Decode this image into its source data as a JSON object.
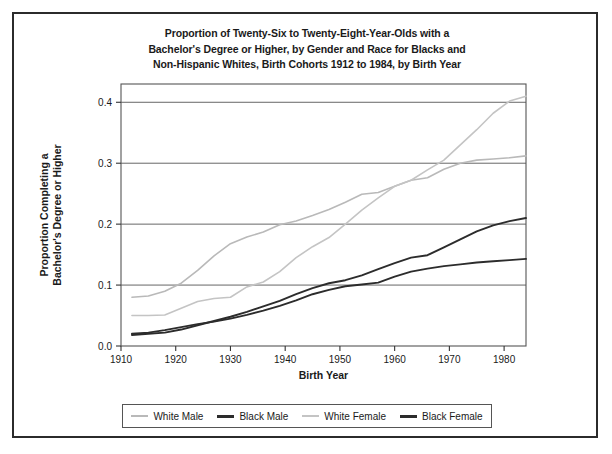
{
  "figure": {
    "title_lines": [
      "Proportion of Twenty-Six to Twenty-Eight-Year-Olds with a",
      "Bachelor's Degree or Higher, by Gender and Race for Blacks and",
      "Non-Hispanic Whites, Birth Cohorts 1912 to 1984, by Birth Year"
    ]
  },
  "chart_data": {
    "type": "line",
    "title": "Proportion of Twenty-Six to Twenty-Eight-Year-Olds with a Bachelor's Degree or Higher, by Gender and Race for Blacks and Non-Hispanic Whites, Birth Cohorts 1912 to 1984, by Birth Year",
    "xlabel": "Birth Year",
    "ylabel": "Proportion Completing a Bachelor's Degree or Higher",
    "xlim": [
      1910,
      1984
    ],
    "ylim": [
      0.0,
      0.43
    ],
    "xticks": [
      1910,
      1920,
      1930,
      1940,
      1950,
      1960,
      1970,
      1980
    ],
    "xtick_labels": [
      "1910",
      "1920",
      "1930",
      "1940",
      "1950",
      "1960",
      "1970",
      "1980"
    ],
    "yticks": [
      0.0,
      0.1,
      0.2,
      0.3,
      0.4
    ],
    "ytick_labels": [
      "0.0",
      "0.1",
      "0.2",
      "0.3",
      "0.4"
    ],
    "grid": "horizontal",
    "legend_position": "below-axes",
    "series": [
      {
        "name": "White Male",
        "color": "#b9b9b9",
        "width": 1.6,
        "x": [
          1912,
          1915,
          1918,
          1921,
          1924,
          1927,
          1930,
          1933,
          1936,
          1939,
          1942,
          1945,
          1948,
          1951,
          1954,
          1957,
          1960,
          1963,
          1966,
          1969,
          1972,
          1975,
          1978,
          1981,
          1984
        ],
        "values": [
          0.08,
          0.082,
          0.09,
          0.103,
          0.124,
          0.148,
          0.168,
          0.179,
          0.187,
          0.199,
          0.205,
          0.214,
          0.224,
          0.236,
          0.249,
          0.252,
          0.262,
          0.272,
          0.276,
          0.29,
          0.3,
          0.305,
          0.307,
          0.309,
          0.312
        ]
      },
      {
        "name": "Black Male",
        "color": "#2c2c2c",
        "width": 1.9,
        "x": [
          1912,
          1915,
          1918,
          1921,
          1924,
          1927,
          1930,
          1933,
          1936,
          1939,
          1942,
          1945,
          1948,
          1951,
          1954,
          1957,
          1960,
          1963,
          1966,
          1969,
          1972,
          1975,
          1978,
          1981,
          1984
        ],
        "values": [
          0.018,
          0.02,
          0.022,
          0.027,
          0.034,
          0.041,
          0.048,
          0.056,
          0.065,
          0.074,
          0.085,
          0.095,
          0.103,
          0.108,
          0.116,
          0.126,
          0.136,
          0.145,
          0.149,
          0.162,
          0.175,
          0.188,
          0.198,
          0.205,
          0.21
        ]
      },
      {
        "name": "White Female",
        "color": "#c4c4c4",
        "width": 1.6,
        "x": [
          1912,
          1915,
          1918,
          1921,
          1924,
          1927,
          1930,
          1933,
          1936,
          1939,
          1942,
          1945,
          1948,
          1951,
          1954,
          1957,
          1960,
          1963,
          1966,
          1969,
          1972,
          1975,
          1978,
          1981,
          1984
        ],
        "values": [
          0.05,
          0.05,
          0.051,
          0.062,
          0.073,
          0.078,
          0.08,
          0.097,
          0.105,
          0.122,
          0.145,
          0.163,
          0.178,
          0.2,
          0.223,
          0.243,
          0.262,
          0.272,
          0.289,
          0.305,
          0.33,
          0.355,
          0.382,
          0.402,
          0.41
        ]
      },
      {
        "name": "Black Female",
        "color": "#2c2c2c",
        "width": 1.9,
        "x": [
          1912,
          1915,
          1918,
          1921,
          1924,
          1927,
          1930,
          1933,
          1936,
          1939,
          1942,
          1945,
          1948,
          1951,
          1954,
          1957,
          1960,
          1963,
          1966,
          1969,
          1972,
          1975,
          1978,
          1981,
          1984
        ],
        "values": [
          0.02,
          0.022,
          0.026,
          0.031,
          0.036,
          0.04,
          0.045,
          0.051,
          0.058,
          0.066,
          0.075,
          0.085,
          0.092,
          0.098,
          0.101,
          0.104,
          0.114,
          0.122,
          0.127,
          0.131,
          0.134,
          0.137,
          0.139,
          0.141,
          0.143
        ]
      }
    ]
  },
  "legend": {
    "entries": [
      {
        "label": "White Male",
        "color": "#b9b9b9"
      },
      {
        "label": "Black Male",
        "color": "#2c2c2c"
      },
      {
        "label": "White Female",
        "color": "#c4c4c4"
      },
      {
        "label": "Black Female",
        "color": "#2c2c2c"
      }
    ]
  },
  "axes": {
    "x_title": "Birth Year",
    "y_title_line1": "Proportion Completing a",
    "y_title_line2": "Bachelor's Degree or Higher"
  }
}
